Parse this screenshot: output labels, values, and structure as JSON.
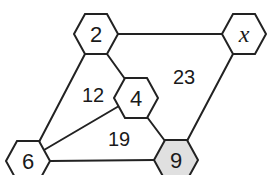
{
  "diagram": {
    "type": "hexagon-number-graph",
    "nodes": [
      {
        "id": "n2",
        "label": "2",
        "cx": 96,
        "cy": 34,
        "fill": "#ffffff",
        "italic": false
      },
      {
        "id": "nx",
        "label": "x",
        "cx": 244,
        "cy": 34,
        "fill": "#ffffff",
        "italic": true
      },
      {
        "id": "n4",
        "label": "4",
        "cx": 136,
        "cy": 98,
        "fill": "#ffffff",
        "italic": false
      },
      {
        "id": "n6",
        "label": "6",
        "cx": 28,
        "cy": 161,
        "fill": "#ffffff",
        "italic": false
      },
      {
        "id": "n9",
        "label": "9",
        "cx": 176,
        "cy": 160,
        "fill": "#e0e0e0",
        "italic": false
      }
    ],
    "edges": [
      {
        "from": "n2",
        "to": "nx",
        "x1": 118,
        "y1": 34,
        "x2": 223,
        "y2": 34
      },
      {
        "from": "n2",
        "to": "n6",
        "x1": 85,
        "y1": 54,
        "x2": 39,
        "y2": 142
      },
      {
        "from": "n2",
        "to": "n4",
        "x1": 107,
        "y1": 54,
        "x2": 125,
        "y2": 79
      },
      {
        "from": "n4",
        "to": "n6",
        "x1": 119,
        "y1": 106,
        "x2": 44,
        "y2": 150
      },
      {
        "from": "n4",
        "to": "n9",
        "x1": 147,
        "y1": 117,
        "x2": 165,
        "y2": 141
      },
      {
        "from": "nx",
        "to": "n9",
        "x1": 233,
        "y1": 54,
        "x2": 187,
        "y2": 141
      },
      {
        "from": "n6",
        "to": "n9",
        "x1": 50,
        "y1": 161,
        "x2": 154,
        "y2": 160
      }
    ],
    "regions": [
      {
        "id": "r12",
        "label": "12",
        "x": 93,
        "y": 102
      },
      {
        "id": "r23",
        "label": "23",
        "x": 184,
        "y": 84
      },
      {
        "id": "r19",
        "label": "19",
        "x": 119,
        "y": 146
      }
    ],
    "hex_size": {
      "half_width": 22,
      "half_height": 20
    },
    "colors": {
      "stroke": "#222222",
      "highlight_fill": "#e0e0e0",
      "background": "#ffffff"
    }
  }
}
